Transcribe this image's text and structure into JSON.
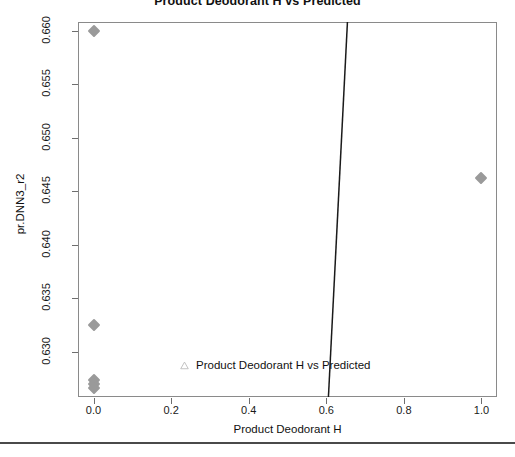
{
  "chart_data": {
    "type": "scatter",
    "title": "Product Deodorant H vs Predicted",
    "xlabel": "Product Deodorant H",
    "ylabel": "pr.DNN3_r2",
    "xlim": [
      -0.04,
      1.04
    ],
    "ylim": [
      0.6258,
      0.6608
    ],
    "grid": false,
    "xticks": [
      "0.0",
      "0.2",
      "0.4",
      "0.6",
      "0.8",
      "1.0"
    ],
    "xtick_values": [
      0.0,
      0.2,
      0.4,
      0.6,
      0.8,
      1.0
    ],
    "yticks": [
      "0.630",
      "0.635",
      "0.640",
      "0.645",
      "0.650",
      "0.655",
      "0.660"
    ],
    "ytick_values": [
      0.63,
      0.635,
      0.64,
      0.645,
      0.65,
      0.655,
      0.66
    ],
    "marker": "diamond",
    "marker_color": "#9a9a9a",
    "points": [
      {
        "x": 0.0,
        "y": 0.66
      },
      {
        "x": 0.0,
        "y": 0.6325
      },
      {
        "x": 0.0,
        "y": 0.6274
      },
      {
        "x": 0.0,
        "y": 0.627
      },
      {
        "x": 0.0,
        "y": 0.6266
      },
      {
        "x": 1.0,
        "y": 0.6462
      }
    ],
    "fit_line": {
      "color": "#1a1a1a",
      "width": 1.5,
      "x_start": 0.6055,
      "y_start": 0.6258,
      "x_end": 0.6545,
      "y_end": 0.6608
    },
    "legend": {
      "position": "bottom-center-inside",
      "entries": [
        {
          "label": "Product Deodorant H vs Predicted",
          "marker": "triangle-open",
          "color": "#bcbcbc"
        }
      ]
    }
  },
  "figure": {
    "title": "Product Deodorant H vs Predicted",
    "x_axis_title": "Product Deodorant H",
    "y_axis_title": "pr.DNN3_r2"
  }
}
